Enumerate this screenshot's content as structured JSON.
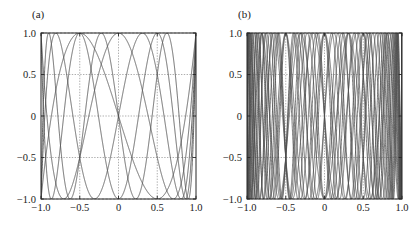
{
  "figure": {
    "background": "#ffffff",
    "curve_color": "#4d4d4d",
    "frame_color": "#262626",
    "grid_color": "#8c8c8c"
  },
  "panels": [
    {
      "id": "a",
      "label": "(a)",
      "chart_data": {
        "type": "line",
        "title": "(a)",
        "xlabel": "",
        "ylabel": "",
        "xlim": [
          -1.0,
          1.0
        ],
        "ylim": [
          -1.0,
          1.0
        ],
        "grid": true,
        "grid_style": "dotted",
        "legend": "none",
        "xticks": [
          -1.0,
          -0.5,
          0,
          0.5,
          1.0
        ],
        "xticklabels": [
          "-1.0",
          "-0.5",
          "0",
          "0.5",
          "1.0"
        ],
        "yticks": [
          -1.0,
          -0.5,
          0,
          0.5,
          1.0
        ],
        "yticklabels": [
          "-1.0",
          "-0.5",
          "0",
          "0.5",
          "1.0"
        ],
        "description": "Chebyshev polynomials of the first kind, low degrees",
        "series": [
          {
            "name": "T3",
            "degree": 3
          },
          {
            "name": "T4",
            "degree": 4
          },
          {
            "name": "T5",
            "degree": 5
          },
          {
            "name": "T6",
            "degree": 6
          },
          {
            "name": "T7",
            "degree": 7
          }
        ]
      }
    },
    {
      "id": "b",
      "label": "(b)",
      "chart_data": {
        "type": "line",
        "title": "(b)",
        "xlabel": "",
        "ylabel": "",
        "xlim": [
          -1.0,
          1.0
        ],
        "ylim": [
          -1.0,
          1.0
        ],
        "grid": true,
        "grid_style": "dotted",
        "legend": "none",
        "xticks": [
          -1.0,
          -0.5,
          0,
          0.5,
          1.0
        ],
        "xticklabels": [
          "-1.0",
          "-0.5",
          "0",
          "0.5",
          "1.0"
        ],
        "yticks": [
          -1.0,
          -0.5,
          0,
          0.5,
          1.0
        ],
        "yticklabels": [
          "-1.0",
          "-0.5",
          "0",
          "0.5",
          "1.0"
        ],
        "description": "Chebyshev polynomials of the first kind, high degrees",
        "series": [
          {
            "name": "T10",
            "degree": 10
          },
          {
            "name": "T11",
            "degree": 11
          },
          {
            "name": "T12",
            "degree": 12
          },
          {
            "name": "T13",
            "degree": 13
          },
          {
            "name": "T14",
            "degree": 14
          },
          {
            "name": "T15",
            "degree": 15
          },
          {
            "name": "T16",
            "degree": 16
          },
          {
            "name": "T17",
            "degree": 17
          },
          {
            "name": "T18",
            "degree": 18
          },
          {
            "name": "T19",
            "degree": 19
          },
          {
            "name": "T20",
            "degree": 20
          }
        ]
      }
    }
  ]
}
